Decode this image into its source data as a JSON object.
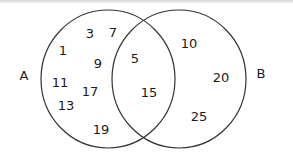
{
  "diagram": {
    "type": "venn",
    "sets": [
      {
        "label": "A",
        "only": [
          "1",
          "3",
          "7",
          "9",
          "11",
          "13",
          "17",
          "19"
        ]
      },
      {
        "label": "B",
        "only": [
          "10",
          "20",
          "25"
        ]
      }
    ],
    "intersection": [
      "5",
      "15"
    ],
    "labels": {
      "set_a": "A",
      "set_b": "B",
      "a_only": {
        "n1": "1",
        "n3": "3",
        "n7": "7",
        "n9": "9",
        "n11": "11",
        "n13": "13",
        "n17": "17",
        "n19": "19"
      },
      "both": {
        "n5": "5",
        "n15": "15"
      },
      "b_only": {
        "n10": "10",
        "n20": "20",
        "n25": "25"
      }
    },
    "stroke_color": "#333333"
  }
}
